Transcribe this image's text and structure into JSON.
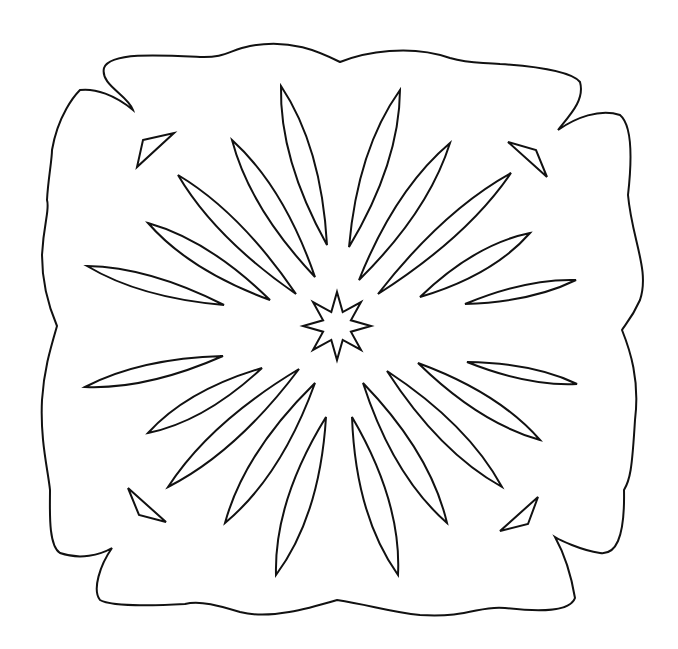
{
  "canvas": {
    "width": 678,
    "height": 649,
    "background": "#ffffff",
    "stroke_color": "#111111",
    "stroke_width": 2
  },
  "outline": {
    "name": "wavy-square-frame",
    "path": "M 104 68 C 110 52 160 55 200 57 C 225 58 230 50 250 46 C 290 38 320 52 340 62 C 365 52 410 44 450 58 C 470 64 480 62 500 64 C 530 66 570 70 580 82 C 585 100 570 115 558 130 C 575 118 600 108 620 115 C 632 125 632 160 628 195 C 632 240 650 270 640 300 C 632 318 625 325 622 330 C 630 350 640 380 635 420 C 632 470 630 480 624 490 C 625 540 615 555 600 553 C 580 550 560 540 555 537 C 565 555 572 580 575 598 C 570 612 540 612 505 608 C 480 605 470 618 420 615 C 390 612 370 605 337 600 C 310 608 270 620 240 612 C 220 606 200 600 185 604 C 150 606 110 606 100 600 C 92 590 100 565 112 548 C 100 555 80 560 60 553 C 48 545 50 510 50 490 C 48 470 40 440 42 400 C 44 370 50 350 57 326 C 48 305 42 280 42 255 C 44 220 50 210 47 200 C 48 180 52 160 52 150 C 58 115 75 95 80 90 C 95 88 115 95 133 110 C 128 95 100 85 104 68 Z"
  },
  "center_star": {
    "name": "eight-point-star",
    "cx": 337,
    "cy": 326,
    "outer_radius": 34,
    "inner_radius": 15,
    "points": 8
  },
  "petals": [
    {
      "name": "petal-top-left-1",
      "outer": [
        281,
        86
      ],
      "inner": [
        327,
        245
      ],
      "width": 22
    },
    {
      "name": "petal-top-right-1",
      "outer": [
        400,
        90
      ],
      "inner": [
        349,
        247
      ],
      "width": 22
    },
    {
      "name": "petal-upper-left-2",
      "outer": [
        232,
        140
      ],
      "inner": [
        315,
        277
      ],
      "width": 20
    },
    {
      "name": "petal-upper-right-2",
      "outer": [
        450,
        143
      ],
      "inner": [
        359,
        280
      ],
      "width": 20
    },
    {
      "name": "petal-upper-left-3",
      "outer": [
        178,
        175
      ],
      "inner": [
        296,
        294
      ],
      "width": 18
    },
    {
      "name": "petal-upper-right-3",
      "outer": [
        511,
        173
      ],
      "inner": [
        378,
        294
      ],
      "width": 18
    },
    {
      "name": "petal-left-4",
      "outer": [
        148,
        223
      ],
      "inner": [
        270,
        300
      ],
      "width": 18
    },
    {
      "name": "petal-right-4",
      "outer": [
        530,
        233
      ],
      "inner": [
        420,
        297
      ],
      "width": 18
    },
    {
      "name": "petal-left-5",
      "outer": [
        87,
        266
      ],
      "inner": [
        224,
        305
      ],
      "width": 16
    },
    {
      "name": "petal-right-5",
      "outer": [
        576,
        280
      ],
      "inner": [
        465,
        304
      ],
      "width": 12
    },
    {
      "name": "petal-left-6",
      "outer": [
        85,
        387
      ],
      "inner": [
        223,
        356
      ],
      "width": 16
    },
    {
      "name": "petal-right-6",
      "outer": [
        577,
        384
      ],
      "inner": [
        467,
        362
      ],
      "width": 12
    },
    {
      "name": "petal-lower-left-7",
      "outer": [
        148,
        433
      ],
      "inner": [
        262,
        368
      ],
      "width": 18
    },
    {
      "name": "petal-lower-right-7",
      "outer": [
        540,
        440
      ],
      "inner": [
        418,
        363
      ],
      "width": 18
    },
    {
      "name": "petal-lower-left-8",
      "outer": [
        168,
        487
      ],
      "inner": [
        299,
        369
      ],
      "width": 20
    },
    {
      "name": "petal-lower-right-8",
      "outer": [
        502,
        487
      ],
      "inner": [
        387,
        371
      ],
      "width": 20
    },
    {
      "name": "petal-lower-left-9",
      "outer": [
        225,
        523
      ],
      "inner": [
        315,
        383
      ],
      "width": 22
    },
    {
      "name": "petal-lower-right-9",
      "outer": [
        447,
        523
      ],
      "inner": [
        363,
        383
      ],
      "width": 22
    },
    {
      "name": "petal-bottom-left-10",
      "outer": [
        276,
        575
      ],
      "inner": [
        326,
        417
      ],
      "width": 24
    },
    {
      "name": "petal-bottom-right-10",
      "outer": [
        398,
        575
      ],
      "inner": [
        352,
        417
      ],
      "width": 24
    }
  ],
  "corner_shards": [
    {
      "name": "shard-top-left",
      "points": "143,140 174,133 137,167"
    },
    {
      "name": "shard-top-right",
      "points": "508,142 536,150 547,177"
    },
    {
      "name": "shard-bottom-left",
      "points": "128,488 139,515 166,522"
    },
    {
      "name": "shard-bottom-right",
      "points": "538,497 528,524 500,531"
    }
  ]
}
